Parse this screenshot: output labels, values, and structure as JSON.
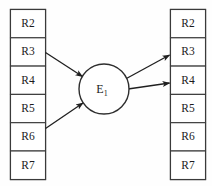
{
  "diagram": {
    "background_color": "#fefefe",
    "stroke_color": "#3a3a3a",
    "text_color": "#1b1b1b",
    "left_column": {
      "name": "left-relation-column",
      "cells": [
        {
          "label": "R2"
        },
        {
          "label": "R3"
        },
        {
          "label": "R4"
        },
        {
          "label": "R5"
        },
        {
          "label": "R6"
        },
        {
          "label": "R7"
        }
      ]
    },
    "right_column": {
      "name": "right-relation-column",
      "cells": [
        {
          "label": "R2"
        },
        {
          "label": "R3"
        },
        {
          "label": "R4"
        },
        {
          "label": "R5"
        },
        {
          "label": "R6"
        },
        {
          "label": "R7"
        }
      ]
    },
    "node": {
      "label": "E",
      "subscript": "1",
      "full_label": "E1"
    },
    "edges": [
      {
        "name": "edge-r3-to-e1",
        "from": "left.R3",
        "to": "E1",
        "direction": "in"
      },
      {
        "name": "edge-r6-to-e1",
        "from": "left.R6",
        "to": "E1",
        "direction": "in"
      },
      {
        "name": "edge-e1-to-r3",
        "from": "E1",
        "to": "right.R3",
        "direction": "out"
      },
      {
        "name": "edge-e1-to-r4",
        "from": "E1",
        "to": "right.R4",
        "direction": "out"
      }
    ]
  }
}
